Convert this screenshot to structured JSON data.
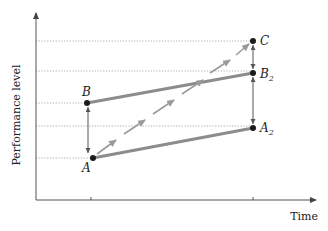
{
  "axes": {
    "y_label": "Performance level",
    "x_label": "Time"
  },
  "points": {
    "A": {
      "label": "A",
      "subscript": ""
    },
    "B": {
      "label": "B",
      "subscript": ""
    },
    "A2": {
      "label": "A",
      "subscript": "2"
    },
    "B2": {
      "label": "B",
      "subscript": "2"
    },
    "C": {
      "label": "C",
      "subscript": ""
    }
  },
  "colors": {
    "axis": "#555555",
    "solid_line": "#8c8c8c",
    "dashed_arrow": "#9a9a9a",
    "gridline": "#999999",
    "point": "#1a1a1a"
  }
}
